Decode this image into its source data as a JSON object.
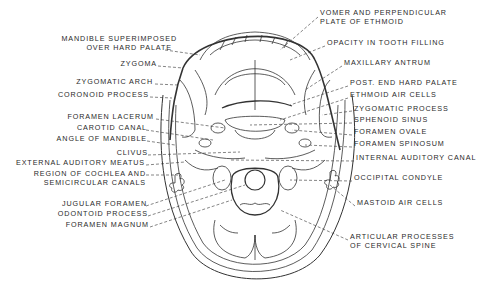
{
  "diagram": {
    "labels_left": [
      {
        "text": "MANDIBLE SUPERIMPOSED",
        "x": 177,
        "y": 38
      },
      {
        "text": "OVER HARD PALATE",
        "x": 172,
        "y": 47
      },
      {
        "text": "ZYGOMA",
        "x": 163,
        "y": 63
      },
      {
        "text": "ZYGOMATIC ARCH",
        "x": 159,
        "y": 81
      },
      {
        "text": "CORONOID PROCESS",
        "x": 155,
        "y": 94
      },
      {
        "text": "FORAMEN LACERUM",
        "x": 163,
        "y": 116
      },
      {
        "text": "CAROTID CANAL",
        "x": 147,
        "y": 127
      },
      {
        "text": "ANGLE OF MANDIBLE",
        "x": 147,
        "y": 138
      },
      {
        "text": "CLIVUS",
        "x": 148,
        "y": 152
      },
      {
        "text": "EXTERNAL AUDITORY MEATUS",
        "x": 145,
        "y": 162
      },
      {
        "text": "REGION OF COCHLEA AND",
        "x": 146,
        "y": 173
      },
      {
        "text": "SEMICIRCULAR CANALS",
        "x": 146,
        "y": 182
      },
      {
        "text": "JUGULAR FORAMEN",
        "x": 146,
        "y": 203
      },
      {
        "text": "ODONTOID PROCESS",
        "x": 148,
        "y": 213
      },
      {
        "text": "FORAMEN MAGNUM",
        "x": 149,
        "y": 224
      }
    ],
    "labels_right": [
      {
        "text": "VOMER AND PERPENDICULAR",
        "x": 320,
        "y": 12
      },
      {
        "text": "PLATE OF ETHMOID",
        "x": 320,
        "y": 21
      },
      {
        "text": "OPACITY IN TOOTH FILLING",
        "x": 327,
        "y": 42
      },
      {
        "text": "MAXILLARY ANTRUM",
        "x": 344,
        "y": 62
      },
      {
        "text": "POST. END HARD PALATE",
        "x": 350,
        "y": 82
      },
      {
        "text": "ETHMOID AIR CELLS",
        "x": 350,
        "y": 94
      },
      {
        "text": "ZYGOMATIC PROCESS",
        "x": 354,
        "y": 108
      },
      {
        "text": "SPHENOID SINUS",
        "x": 354,
        "y": 119
      },
      {
        "text": "FORAMEN OVALE",
        "x": 354,
        "y": 131
      },
      {
        "text": "FORAMEN SPINOSUM",
        "x": 354,
        "y": 143
      },
      {
        "text": "INTERNAL AUDITORY CANAL",
        "x": 356,
        "y": 157
      },
      {
        "text": "OCCIPITAL CONDYLE",
        "x": 354,
        "y": 177
      },
      {
        "text": "MASTOID AIR CELLS",
        "x": 357,
        "y": 202
      },
      {
        "text": "ARTICULAR PROCESSES",
        "x": 350,
        "y": 236
      },
      {
        "text": "OF CERVICAL SPINE",
        "x": 350,
        "y": 245
      }
    ]
  }
}
